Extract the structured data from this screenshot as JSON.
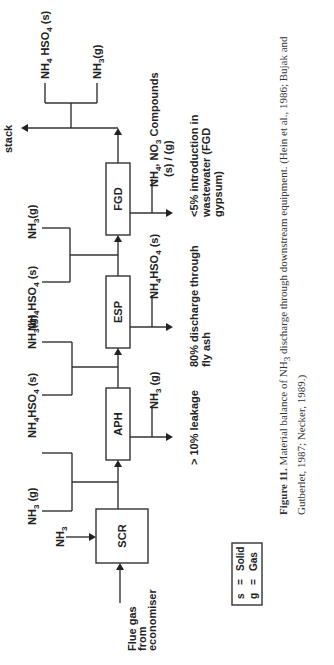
{
  "figure": {
    "units": {
      "scr": "SCR",
      "aph": "APH",
      "esp": "ESP",
      "fgd": "FGD"
    },
    "inputs": {
      "flue_gas_l1": "Flue gas",
      "flue_gas_l2": "from",
      "flue_gas_l3": "economiser",
      "nh3_injection": "NH",
      "nh3_injection_sub": "3"
    },
    "between_streams": {
      "scr_aph": [
        {
          "main": "NH",
          "sub": "3",
          "tail": " (g)"
        }
      ],
      "aph_esp_top": {
        "main": "NH",
        "sub": "4",
        "mid": "HSO",
        "sub2": "4",
        "tail": " (s)"
      },
      "aph_esp_bottom": {
        "main": "NH",
        "sub": "3",
        "tail": "(g)"
      },
      "esp_fgd_top": {
        "main": "NH",
        "sub": "4",
        "mid": "HSO",
        "sub2": "4",
        "tail": " (s)"
      },
      "esp_fgd_bottom": {
        "main": "NH",
        "sub": "3",
        "tail": "(g)"
      },
      "stack_top": {
        "main": "NH",
        "sub": "4",
        "mid": " HSO",
        "sub2": "4",
        "tail": " (s)"
      },
      "stack_bottom": {
        "main": "NH",
        "sub": "3",
        "tail": "(g)"
      }
    },
    "outlets": {
      "aph": {
        "main": "NH",
        "sub": "3",
        "tail": " (g)"
      },
      "esp": {
        "main": "NH",
        "sub": "4",
        "mid": "HSO",
        "sub2": "4",
        "tail": " (s)"
      },
      "fgd_l1_a": "NH",
      "fgd_l1_sub": "4",
      "fgd_l1_b": ", NO",
      "fgd_l1_sub2": "3",
      "fgd_l1_c": " Compounds",
      "fgd_l2": "(s)  /  (g)"
    },
    "stack_label": "stack",
    "notes": {
      "aph": "> 10% leakage",
      "esp_l1": "80% discharge through",
      "esp_l2": "fly ash",
      "fgd_l1": "<5% introduction in",
      "fgd_l2": "wastewater (FGD",
      "fgd_l3": "gypsum)"
    },
    "legend": {
      "row1_key": "s",
      "row1_eq": "=",
      "row1_val": "Solid",
      "row2_key": "g",
      "row2_eq": "=",
      "row2_val": "Gas"
    }
  },
  "caption": {
    "label": "Figure 11.",
    "text_a": " Material balance of NH",
    "text_sub": "3",
    "text_b": " discharge through downstream equipment. (Hein et al., 1986; Bujak and Gutberlet, 1987; Necker, 1989.)"
  }
}
